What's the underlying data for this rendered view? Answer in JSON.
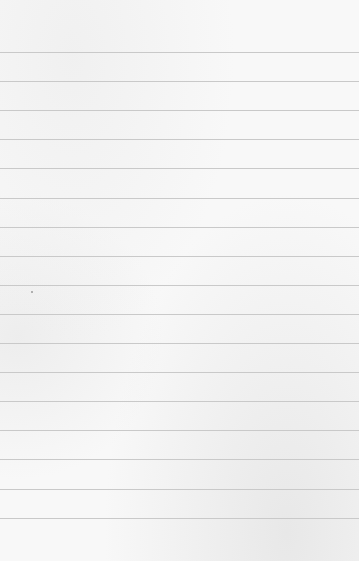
{
  "page": {
    "kind": "blank-lined-paper",
    "rule_count": 17,
    "colors": {
      "paper": "#f8f8f8",
      "rule": "#c9c9c9",
      "speck": "#9a9a9a"
    }
  }
}
